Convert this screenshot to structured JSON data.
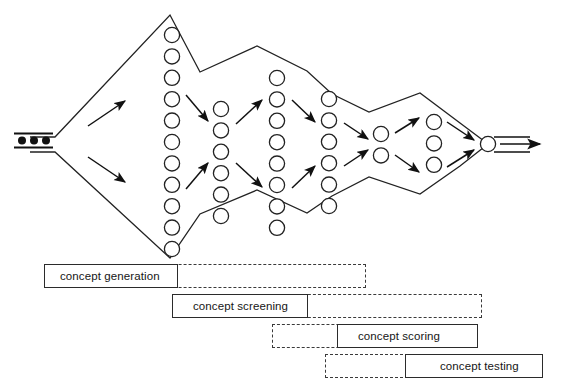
{
  "diagram": {
    "type": "funnel-process-diagram",
    "stroke_color": "#222222",
    "fill_color": "#ffffff",
    "input": {
      "name": "input-dots",
      "dot_count": 3,
      "dots_label": "•••"
    },
    "output": {
      "name": "output-arrow",
      "circle_count": 1
    },
    "columns": [
      {
        "id": "col1",
        "label": "generated concepts",
        "count": 11,
        "cx": 172,
        "cy_start": 35,
        "spacing": 21.4,
        "r": 7.6
      },
      {
        "id": "col2",
        "label": "screened concepts",
        "count": 6,
        "cx": 221,
        "cy_start": 109,
        "spacing": 21.4,
        "r": 7.6
      },
      {
        "id": "col3",
        "label": "scored concepts",
        "count": 8,
        "cx": 277,
        "cy_start": 78,
        "spacing": 21.4,
        "r": 7.6
      },
      {
        "id": "col4",
        "label": "refined concepts",
        "count": 6,
        "cx": 329,
        "cy_start": 99,
        "spacing": 21.4,
        "r": 7.6
      },
      {
        "id": "col5",
        "label": "candidate concepts",
        "count": 2,
        "cx": 381,
        "cy_start": 134,
        "spacing": 21.4,
        "r": 7.6
      },
      {
        "id": "col6",
        "label": "tested concepts",
        "count": 3,
        "cx": 434,
        "cy_start": 122,
        "spacing": 21.4,
        "r": 7.6
      },
      {
        "id": "col7",
        "label": "selected concept",
        "count": 1,
        "cx": 488,
        "cy_start": 144,
        "spacing": 21.4,
        "r": 7.6
      }
    ],
    "outline_points": "30,137 55,137 170,15 200,72 257,46 307,71 332,94 369,112 420,93 460,123 488,144 460,166 420,194 369,177 332,196 307,213 257,190 200,214 170,258 55,152 30,152",
    "arrows": [
      {
        "name": "arrow-fan-up",
        "x1": 88,
        "y1": 126,
        "x2": 125,
        "y2": 101
      },
      {
        "name": "arrow-fan-down",
        "x1": 88,
        "y1": 157,
        "x2": 125,
        "y2": 182
      },
      {
        "name": "arrow-c1-c2-upper",
        "x1": 186,
        "y1": 95,
        "x2": 208,
        "y2": 121
      },
      {
        "name": "arrow-c1-c2-lower",
        "x1": 186,
        "y1": 189,
        "x2": 208,
        "y2": 163
      },
      {
        "name": "arrow-c2-c3-upper",
        "x1": 236,
        "y1": 124,
        "x2": 262,
        "y2": 100
      },
      {
        "name": "arrow-c2-c3-lower",
        "x1": 236,
        "y1": 163,
        "x2": 262,
        "y2": 187
      },
      {
        "name": "arrow-c3-c4-upper",
        "x1": 292,
        "y1": 100,
        "x2": 315,
        "y2": 122
      },
      {
        "name": "arrow-c3-c4-lower",
        "x1": 292,
        "y1": 188,
        "x2": 315,
        "y2": 166
      },
      {
        "name": "arrow-c4-c5-upper",
        "x1": 344,
        "y1": 123,
        "x2": 368,
        "y2": 139
      },
      {
        "name": "arrow-c4-c5-lower",
        "x1": 344,
        "y1": 166,
        "x2": 368,
        "y2": 150
      },
      {
        "name": "arrow-c5-c6-upper",
        "x1": 395,
        "y1": 133,
        "x2": 419,
        "y2": 118
      },
      {
        "name": "arrow-c5-c6-lower",
        "x1": 395,
        "y1": 155,
        "x2": 419,
        "y2": 172
      },
      {
        "name": "arrow-c6-c7-upper",
        "x1": 447,
        "y1": 122,
        "x2": 474,
        "y2": 140
      },
      {
        "name": "arrow-c6-c7-lower",
        "x1": 447,
        "y1": 167,
        "x2": 474,
        "y2": 150
      },
      {
        "name": "arrow-exit",
        "x1": 500,
        "y1": 144,
        "x2": 540,
        "y2": 144
      }
    ]
  },
  "stages": [
    {
      "name": "stage-concept-generation",
      "label": "concept generation",
      "solid_left": 44,
      "solid_width": 134,
      "dashed_left": 44,
      "dashed_width": 322,
      "text_left": 60,
      "top": 264
    },
    {
      "name": "stage-concept-screening",
      "label": "concept screening",
      "solid_left": 172,
      "solid_width": 136,
      "dashed_left": 172,
      "dashed_width": 310,
      "text_left": 193,
      "top": 294
    },
    {
      "name": "stage-concept-scoring",
      "label": "concept scoring",
      "solid_left": 337,
      "solid_width": 141,
      "dashed_left": 272,
      "dashed_width": 206,
      "text_left": 358,
      "top": 324
    },
    {
      "name": "stage-concept-testing",
      "label": "concept testing",
      "solid_left": 405,
      "solid_width": 138,
      "dashed_left": 325,
      "dashed_width": 218,
      "text_left": 440,
      "top": 354
    }
  ]
}
